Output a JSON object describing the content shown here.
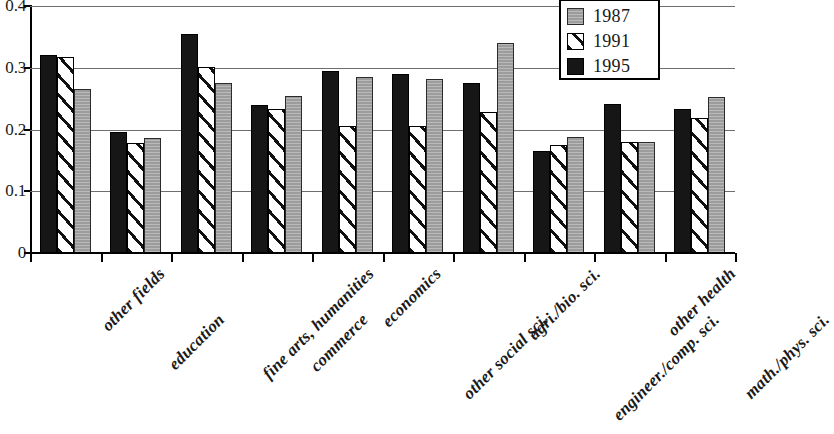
{
  "chart_data": {
    "type": "bar",
    "title": "",
    "subtitle": "",
    "xlabel": "",
    "ylabel": "",
    "ylim": [
      0,
      0.4
    ],
    "grid": true,
    "legend_position": "top-right",
    "y_ticks": [
      "0",
      "0.1",
      "0.2",
      "0.3",
      "0.4"
    ],
    "y_tick_values": [
      0,
      0.1,
      0.2,
      0.3,
      0.4
    ],
    "categories": [
      "other fields",
      "education",
      "fine arts, humanities",
      "commerce",
      "economics",
      "other social  sci.",
      "agri./bio. sci.",
      "engineer./comp. sci.",
      "other health",
      "math./phys. sci."
    ],
    "series": [
      {
        "name": "1995",
        "color": "#161616",
        "pattern": "solid-black",
        "values": [
          0.32,
          0.196,
          0.355,
          0.24,
          0.295,
          0.29,
          0.275,
          0.165,
          0.242,
          0.233
        ]
      },
      {
        "name": "1991",
        "color": "#ffffff",
        "pattern": "diagonal-hatch",
        "values": [
          0.317,
          0.178,
          0.301,
          0.234,
          0.205,
          0.205,
          0.228,
          0.175,
          0.179,
          0.218
        ]
      },
      {
        "name": "1987",
        "color": "#9c9c9c",
        "pattern": "solid-gray",
        "values": [
          0.265,
          0.186,
          0.275,
          0.255,
          0.285,
          0.281,
          0.34,
          0.188,
          0.18,
          0.253
        ]
      }
    ],
    "series_draw_order": [
      "1995",
      "1991",
      "1987"
    ],
    "legend_order": [
      "1987",
      "1991",
      "1995"
    ]
  },
  "legend": {
    "items": [
      {
        "label": "1987",
        "swatch": "s1987"
      },
      {
        "label": "1991",
        "swatch": "s1991"
      },
      {
        "label": "1995",
        "swatch": "s1995"
      }
    ]
  }
}
